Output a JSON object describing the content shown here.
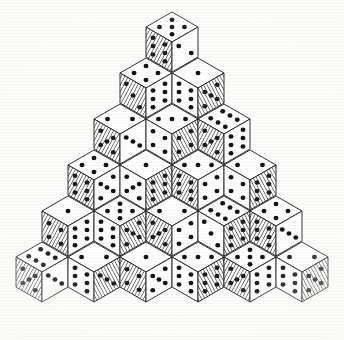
{
  "figure": {
    "kind": "isometric-stack",
    "style": "engraving",
    "background_color": "#fdfdfc",
    "ink_color": "#131313",
    "pip_color": "#131313",
    "hatch_color": "#2a2a2a",
    "rows": 6,
    "total_dice": 21
  },
  "geometry": {
    "apex_x": 172,
    "apex_y": 12,
    "half_width": 26,
    "face_height": 30,
    "row_step_y": 46,
    "col_step_x": 26,
    "left_extent_x": 17,
    "right_extent_x": 327,
    "bottom_extent_y": 323
  },
  "legend": {
    "face_top_label": "top face",
    "face_left_label": "left face",
    "face_right_label": "right face",
    "shaded_label": "hatched (shaded) face",
    "plain_label": "plain (lit) face"
  },
  "dice": [
    {
      "row": 1,
      "col": 0,
      "top": 5,
      "left": 6,
      "right": 2,
      "left_shaded": true,
      "right_shaded": false
    },
    {
      "row": 2,
      "col": 0,
      "top": 4,
      "left": 3,
      "right": 6,
      "left_shaded": true,
      "right_shaded": false
    },
    {
      "row": 2,
      "col": 1,
      "top": 1,
      "left": 6,
      "right": 5,
      "left_shaded": false,
      "right_shaded": true
    },
    {
      "row": 3,
      "col": 0,
      "top": 2,
      "left": 5,
      "right": 3,
      "left_shaded": true,
      "right_shaded": false
    },
    {
      "row": 3,
      "col": 1,
      "top": 3,
      "left": 4,
      "right": 4,
      "left_shaded": false,
      "right_shaded": true
    },
    {
      "row": 3,
      "col": 2,
      "top": 6,
      "left": 5,
      "right": 6,
      "left_shaded": true,
      "right_shaded": false
    },
    {
      "row": 4,
      "col": 0,
      "top": 4,
      "left": 6,
      "right": 5,
      "left_shaded": true,
      "right_shaded": false
    },
    {
      "row": 4,
      "col": 1,
      "top": 1,
      "left": 5,
      "right": 6,
      "left_shaded": false,
      "right_shaded": true
    },
    {
      "row": 4,
      "col": 2,
      "top": 3,
      "left": 6,
      "right": 4,
      "left_shaded": true,
      "right_shaded": false
    },
    {
      "row": 4,
      "col": 3,
      "top": 2,
      "left": 4,
      "right": 6,
      "left_shaded": false,
      "right_shaded": true
    },
    {
      "row": 5,
      "col": 0,
      "top": 1,
      "left": 4,
      "right": 6,
      "left_shaded": true,
      "right_shaded": false
    },
    {
      "row": 5,
      "col": 1,
      "top": 5,
      "left": 6,
      "right": 5,
      "left_shaded": false,
      "right_shaded": true
    },
    {
      "row": 5,
      "col": 2,
      "top": 2,
      "left": 5,
      "right": 4,
      "left_shaded": true,
      "right_shaded": false
    },
    {
      "row": 5,
      "col": 3,
      "top": 6,
      "left": 3,
      "right": 6,
      "left_shaded": false,
      "right_shaded": true
    },
    {
      "row": 5,
      "col": 4,
      "top": 4,
      "left": 6,
      "right": 3,
      "left_shaded": true,
      "right_shaded": false
    },
    {
      "row": 6,
      "col": 0,
      "top": 6,
      "left": 5,
      "right": 3,
      "left_shaded": true,
      "right_shaded": false
    },
    {
      "row": 6,
      "col": 1,
      "top": 2,
      "left": 6,
      "right": 3,
      "left_shaded": false,
      "right_shaded": true
    },
    {
      "row": 6,
      "col": 2,
      "top": 1,
      "left": 4,
      "right": 5,
      "left_shaded": true,
      "right_shaded": false
    },
    {
      "row": 6,
      "col": 3,
      "top": 3,
      "left": 6,
      "right": 6,
      "left_shaded": false,
      "right_shaded": true
    },
    {
      "row": 6,
      "col": 4,
      "top": 5,
      "left": 5,
      "right": 6,
      "left_shaded": true,
      "right_shaded": false
    },
    {
      "row": 6,
      "col": 5,
      "top": 2,
      "left": 6,
      "right": 5,
      "left_shaded": false,
      "right_shaded": true
    }
  ]
}
